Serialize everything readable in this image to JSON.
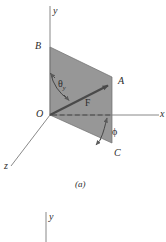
{
  "figure": {
    "caption_a": "(a)",
    "panel_a": {
      "axes": [
        {
          "name": "y-axis",
          "label": "y",
          "x1": 50,
          "y1": 115,
          "x2": 50,
          "y2": 6
        },
        {
          "name": "x-axis",
          "label": "x",
          "x1": 50,
          "y1": 115,
          "x2": 159,
          "y2": 115
        },
        {
          "name": "z-axis",
          "label": "z",
          "x1": 50,
          "y1": 115,
          "x2": 11,
          "y2": 166
        }
      ],
      "axis_labels": {
        "y": "y",
        "x": "x",
        "z": "z"
      },
      "points": {
        "origin": "O",
        "upper_left": "B",
        "upper_right": "A",
        "lower_right": "C"
      },
      "vector_label": "F",
      "angle_theta": "θ",
      "angle_theta_subscript": "y",
      "angle_phi": "ϕ",
      "shaded_plane": {
        "name": "force-plane",
        "vertices": [
          [
            50,
            47
          ],
          [
            112,
            77
          ],
          [
            112,
            143
          ],
          [
            50,
            115
          ]
        ]
      },
      "force_vector": {
        "from": [
          50,
          115
        ],
        "to": [
          111,
          84
        ]
      },
      "dashed_projection": {
        "from": [
          50,
          115
        ],
        "to": [
          112,
          115
        ]
      }
    },
    "panel_b": {
      "axes": [
        {
          "name": "y-axis",
          "label": "y",
          "x1": 46,
          "y1": 242,
          "x2": 46,
          "y2": 212
        }
      ],
      "axis_labels": {
        "y": "y"
      }
    }
  },
  "colors": {
    "plane_fill": "#8e8e8e",
    "plane_edge": "#6d6d6d",
    "axis_line": "#7a7a7a",
    "vector": "#4a4a4a",
    "text": "#2b2b2b",
    "background": "#ffffff"
  }
}
